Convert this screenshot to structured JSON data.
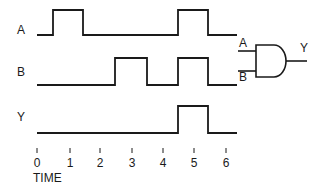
{
  "signals": [
    {
      "name": "A",
      "label_x": 17,
      "label_y": 24,
      "low_y": 35,
      "high_y": 10,
      "segments": [
        [
          37,
          "L"
        ],
        [
          53,
          "H"
        ],
        [
          83,
          "L"
        ],
        [
          178,
          "H"
        ],
        [
          208,
          "L"
        ],
        [
          237,
          "E"
        ]
      ]
    },
    {
      "name": "B",
      "label_x": 17,
      "label_y": 66,
      "low_y": 85,
      "high_y": 58,
      "segments": [
        [
          37,
          "L"
        ],
        [
          115,
          "H"
        ],
        [
          147,
          "L"
        ],
        [
          178,
          "H"
        ],
        [
          208,
          "L"
        ],
        [
          237,
          "E"
        ]
      ]
    },
    {
      "name": "Y",
      "label_x": 17,
      "label_y": 111,
      "low_y": 133,
      "high_y": 106,
      "segments": [
        [
          37,
          "L"
        ],
        [
          178,
          "H"
        ],
        [
          208,
          "L"
        ],
        [
          237,
          "E"
        ]
      ]
    }
  ],
  "time_axis": {
    "label": "TIME",
    "ticks": [
      {
        "value": "0",
        "x": 37
      },
      {
        "value": "1",
        "x": 70
      },
      {
        "value": "2",
        "x": 100
      },
      {
        "value": "3",
        "x": 132
      },
      {
        "value": "4",
        "x": 163
      },
      {
        "value": "5",
        "x": 194
      },
      {
        "value": "6",
        "x": 226
      }
    ]
  },
  "gate": {
    "type": "AND",
    "input_a_label": "A",
    "input_b_label": "B",
    "output_label": "Y"
  }
}
